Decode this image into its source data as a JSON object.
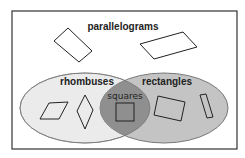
{
  "diagram": {
    "type": "venn",
    "outer_set": {
      "label": "parallelograms"
    },
    "sets": [
      {
        "label": "rhombuses",
        "fill": "#ebebeb"
      },
      {
        "label": "rectangles",
        "fill": "#c4c4c4"
      }
    ],
    "intersection": {
      "label": "squares",
      "fill": "#8f8f8f"
    },
    "colors": {
      "frame": "#333333",
      "ellipse_stroke": "#999999",
      "shape_stroke": "#222222"
    }
  }
}
